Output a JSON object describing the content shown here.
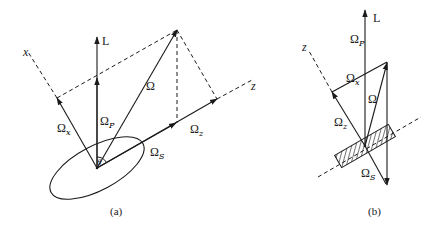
{
  "figure": {
    "panels": [
      {
        "id": "a",
        "caption": "(a)",
        "labels": {
          "L": "L",
          "x_axis": "x",
          "z_axis": "z",
          "omega": "Ω",
          "omega_p": "Ω",
          "omega_p_sub": "P",
          "omega_x": "Ω",
          "omega_x_sub": "x",
          "omega_z": "Ω",
          "omega_z_sub": "z",
          "omega_s": "Ω",
          "omega_s_sub": "S",
          "theta": "θ"
        }
      },
      {
        "id": "b",
        "caption": "(b)",
        "labels": {
          "L": "L",
          "z_axis": "z",
          "omega": "Ω",
          "omega_p": "Ω",
          "omega_p_sub": "P",
          "omega_x": "Ω",
          "omega_x_sub": "x",
          "omega_z": "Ω",
          "omega_z_sub": "z",
          "omega_s": "Ω",
          "omega_s_sub": "S"
        }
      }
    ],
    "colors": {
      "ink": "#1a1a1a",
      "background": "#ffffff"
    }
  }
}
